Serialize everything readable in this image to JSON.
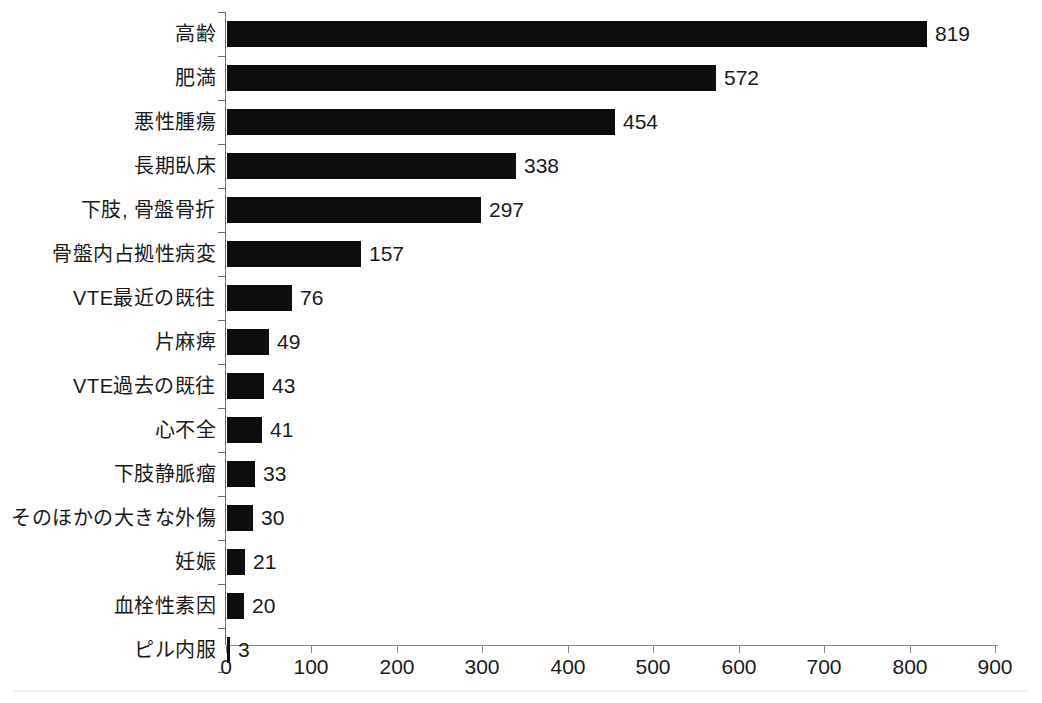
{
  "chart_data": {
    "type": "bar",
    "orientation": "horizontal",
    "title": "",
    "xlabel": "",
    "ylabel": "",
    "xlim": [
      0,
      900
    ],
    "grid": false,
    "legend": null,
    "bar_color": "#0d0d0d",
    "axis_color": "#6d6d6d",
    "categories": [
      "高齢",
      "肥満",
      "悪性腫瘍",
      "長期臥床",
      "下肢, 骨盤骨折",
      "骨盤内占拠性病変",
      "VTE最近の既往",
      "片麻痺",
      "VTE過去の既往",
      "心不全",
      "下肢静脈瘤",
      "そのほかの大きな外傷",
      "妊娠",
      "血栓性素因",
      "ピル内服"
    ],
    "values": [
      819,
      572,
      454,
      338,
      297,
      157,
      76,
      49,
      43,
      41,
      33,
      30,
      21,
      20,
      3
    ],
    "value_labels": [
      "819",
      "572",
      "454",
      "338",
      "297",
      "157",
      "76",
      "49",
      "43",
      "41",
      "33",
      "30",
      "21",
      "20",
      "3"
    ],
    "xticks": [
      0,
      100,
      200,
      300,
      400,
      500,
      600,
      700,
      800,
      900
    ],
    "xtick_labels": [
      "0",
      "100",
      "200",
      "300",
      "400",
      "500",
      "600",
      "700",
      "800",
      "900"
    ]
  }
}
